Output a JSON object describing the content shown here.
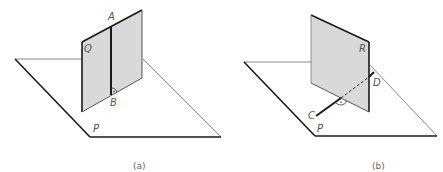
{
  "figures": [
    {
      "id": "a",
      "caption": "(a)",
      "plane_label": "P",
      "vertical_plane_label": "Q",
      "line_points": [
        "A",
        "B"
      ],
      "right_angle_at": "B",
      "description": "Line AB lies in plane Q, perpendicular to the intersection of Q with P"
    },
    {
      "id": "b",
      "caption": "(b)",
      "plane_label": "P",
      "vertical_plane_label": "R",
      "line_points": [
        "C",
        "D"
      ],
      "right_angle_at": "intersection of CD with R",
      "description": "Line CD in plane P pierces plane R perpendicularly; portion behind R is dashed"
    }
  ],
  "colors": {
    "plane_fill": "#d9d9d9",
    "stroke_dark": "#1a1a1a",
    "stroke_light": "#777777",
    "label": "#555555"
  }
}
